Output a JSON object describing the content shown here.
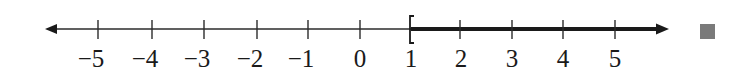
{
  "number_line": {
    "min_label": -5,
    "max_label": 5,
    "tick_labels": [
      "−5",
      "−4",
      "−3",
      "−2",
      "−1",
      "0",
      "1",
      "2",
      "3",
      "4",
      "5"
    ],
    "tick_values": [
      -5,
      -4,
      -3,
      -2,
      -1,
      0,
      1,
      2,
      3,
      4,
      5
    ],
    "left_arrow": true,
    "right_arrow": true,
    "shaded_interval": {
      "start": 1,
      "start_bracket": "[",
      "start_inclusive": true,
      "end": "infinity",
      "direction": "right"
    },
    "notation": "[1, ∞)"
  },
  "end_marker": {
    "shape": "square",
    "color": "#7a7a7a"
  },
  "colors": {
    "line": "#2b2b2b",
    "shaded_line": "#1a1a1a",
    "text": "#1a1a1a",
    "background": "#ffffff"
  }
}
